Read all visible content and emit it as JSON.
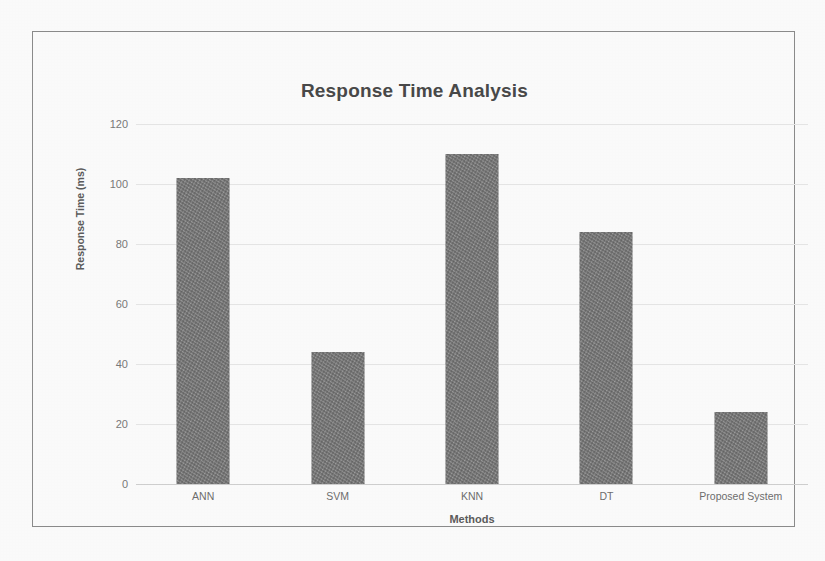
{
  "chart_data": {
    "type": "bar",
    "title": "Response Time Analysis",
    "xlabel": "Methods",
    "ylabel": "Response Time (ms)",
    "categories": [
      "ANN",
      "SVM",
      "KNN",
      "DT",
      "Proposed System"
    ],
    "values": [
      102,
      44,
      110,
      84,
      24
    ],
    "ylim": [
      0,
      120
    ],
    "yticks": [
      "0",
      "20",
      "40",
      "60",
      "80",
      "100",
      "120"
    ],
    "ytick_values": [
      0,
      20,
      40,
      60,
      80,
      100,
      120
    ],
    "grid": true,
    "legend": "none",
    "series": [
      {
        "name": "Response Time (ms)",
        "values": [
          102,
          44,
          110,
          84,
          24
        ],
        "color": "#7e7e7e"
      }
    ],
    "colors": {
      "bar": "#7e7e7e",
      "gridline": "#e9e9e9",
      "axis": "#d2d2d2",
      "title_text": "#4a4a4a",
      "tick_text": "#7b7b7b",
      "frame_border": "#8d8d8d",
      "background": "#ffffff"
    }
  }
}
